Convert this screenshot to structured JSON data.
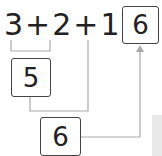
{
  "equation": {
    "terms": [
      "3",
      "+",
      "2",
      "+",
      "1",
      "="
    ],
    "result_box": "6"
  },
  "steps": {
    "first_sum_box": "5",
    "second_sum_box": "6"
  },
  "colors": {
    "line": "#aaaaaa",
    "box_border": "#444444",
    "text": "#222222"
  }
}
